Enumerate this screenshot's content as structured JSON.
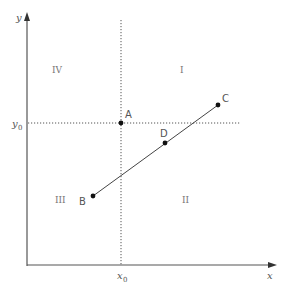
{
  "diagram": {
    "axes": {
      "x_label": "x",
      "y_label": "y",
      "x0_label": "x",
      "x0_sub": "0",
      "y0_label": "y",
      "y0_sub": "0"
    },
    "quadrants": [
      {
        "id": "IV",
        "label": "IV"
      },
      {
        "id": "I",
        "label": "I"
      },
      {
        "id": "III",
        "label": "III"
      },
      {
        "id": "II",
        "label": "II"
      }
    ],
    "points": [
      {
        "id": "A",
        "label": "A"
      },
      {
        "id": "B",
        "label": "B"
      },
      {
        "id": "C",
        "label": "C"
      },
      {
        "id": "D",
        "label": "D"
      }
    ],
    "colors": {
      "axis": "#555555",
      "line": "#444444",
      "dotted": "#555555",
      "point": "#111111",
      "text": "#555555"
    }
  }
}
